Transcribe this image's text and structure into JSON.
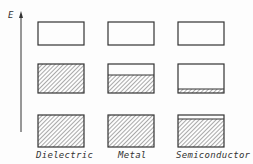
{
  "axis": {
    "label": "E"
  },
  "columns": [
    {
      "label": "Dielectric",
      "middle_band_fill": 1.0,
      "bottom_band_fill": 1.0,
      "bottom_gap_top": false
    },
    {
      "label": "Metal",
      "middle_band_fill": 0.6,
      "bottom_band_fill": 1.0,
      "bottom_gap_top": false
    },
    {
      "label": "Semiconductor",
      "middle_band_fill": 0.15,
      "bottom_band_fill": 0.88,
      "bottom_gap_top": true
    }
  ],
  "colors": {
    "line": "#333333",
    "hatch": "#555555",
    "background": "#fdfdfd"
  }
}
